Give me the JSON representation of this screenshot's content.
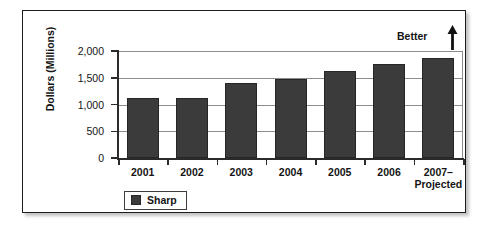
{
  "chart_data": {
    "type": "bar",
    "title": "",
    "xlabel": "",
    "ylabel": "Dollars (Millions)",
    "categories": [
      "2001",
      "2002",
      "2003",
      "2004",
      "2005",
      "2006",
      "2007–\nProjected"
    ],
    "category_lines": [
      [
        "2001"
      ],
      [
        "2002"
      ],
      [
        "2003"
      ],
      [
        "2004"
      ],
      [
        "2005"
      ],
      [
        "2006"
      ],
      [
        "2007–",
        "Projected"
      ]
    ],
    "values": [
      1130,
      1120,
      1400,
      1470,
      1630,
      1760,
      1870
    ],
    "series": [
      {
        "name": "Sharp",
        "color": "#3b3b3b",
        "values": [
          1130,
          1120,
          1400,
          1470,
          1630,
          1760,
          1870
        ]
      }
    ],
    "ylim": [
      0,
      2000
    ],
    "yticks": [
      0,
      500,
      1000,
      1500,
      2000
    ],
    "ytick_labels": [
      "0",
      "500",
      "1,000",
      "1,500",
      "2,000"
    ],
    "grid": true,
    "legend_position": "bottom-left",
    "annotations": [
      {
        "text": "Better",
        "icon": "up-arrow",
        "position": "top-right"
      }
    ]
  },
  "legend": {
    "items": [
      {
        "label": "Sharp",
        "color": "#3b3b3b"
      }
    ]
  },
  "annotation": {
    "better_label": "Better"
  },
  "colors": {
    "bar": "#3b3b3b",
    "grid": "#8d8d8d",
    "axis": "#2b2b2b",
    "frame": "#1d1d1d",
    "text": "#141414"
  }
}
